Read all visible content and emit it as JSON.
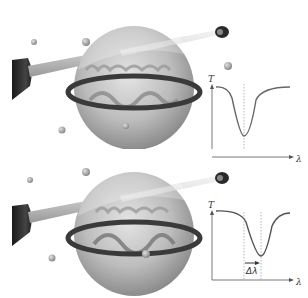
{
  "figure": {
    "colors": {
      "sphere": "#b5b5b5",
      "ring": "#3a3a3a",
      "fiber": "#cfcfcf",
      "particle": "#9a9a9a",
      "curve": "#666666"
    }
  },
  "panels": [
    {
      "id": "top",
      "state": "before binding",
      "plot": {
        "ylabel": "T",
        "xlabel": "λ"
      }
    },
    {
      "id": "bottom",
      "state": "after binding",
      "plot": {
        "ylabel": "T",
        "xlabel": "λ",
        "shift_label": "Δλ"
      }
    }
  ]
}
